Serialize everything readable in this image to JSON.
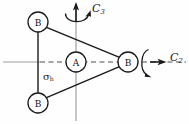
{
  "figure": {
    "name": "symmetry-elements-diagram",
    "background": "#fefefe",
    "width": 189,
    "height": 124
  },
  "atoms": [
    {
      "id": "b-top-left",
      "label": "B",
      "cx": 38,
      "cy": 22,
      "r": 10
    },
    {
      "id": "b-bottom-left",
      "label": "B",
      "cx": 38,
      "cy": 103,
      "r": 10
    },
    {
      "id": "b-right",
      "label": "B",
      "cx": 128,
      "cy": 62,
      "r": 10
    },
    {
      "id": "a-center",
      "label": "A",
      "cx": 76,
      "cy": 62,
      "r": 10
    }
  ],
  "labels": {
    "c3": {
      "base": "C",
      "sub": "3",
      "x": 92,
      "y": 5
    },
    "c2": {
      "base": "C",
      "sub": "2",
      "x": 168,
      "y": 54
    },
    "sigma_h": {
      "base": "σ",
      "sub": "h",
      "x": 44,
      "y": 72
    }
  },
  "colors": {
    "bond": "#1a1a1a",
    "axis": "#9a9a9a",
    "dashed_axis": "#8e8e8e",
    "arrow": "#1a1a1a",
    "text": "#1a1a1a",
    "circle_stroke": "#1a1a1a",
    "circle_fill": "#ffffff"
  },
  "axes": {
    "vertical_axis": {
      "name": "c3-rotation-axis",
      "x": 76,
      "y_top": 8,
      "y_bottom": 120
    },
    "horizontal_axis": {
      "name": "c2-rotation-axis",
      "y": 62,
      "x_left": 2,
      "x_right": 186
    },
    "mirror_plane": {
      "name": "sigma-h-plane",
      "style": "dashed"
    }
  },
  "arrows": {
    "c3_vertical": {
      "name": "c3-axis-arrowhead",
      "direction": "up"
    },
    "c3_curved": {
      "name": "c3-curved-rotation-arrow",
      "direction": "counterclockwise"
    },
    "c2_straight": {
      "name": "c2-axis-arrowhead",
      "direction": "right"
    },
    "c2_curved": {
      "name": "c2-curved-rotation-arrow",
      "direction": "clockwise"
    }
  }
}
